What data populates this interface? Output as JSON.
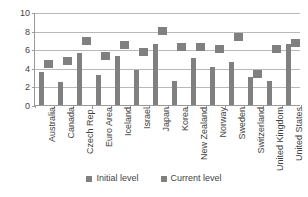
{
  "chart_data": {
    "type": "bar",
    "title": "",
    "subtitle": "",
    "xlabel": "",
    "ylabel": "",
    "ylim": [
      0,
      10
    ],
    "y_ticks": [
      0,
      2,
      4,
      6,
      8,
      10
    ],
    "grid": true,
    "legend_position": "bottom",
    "categories": [
      "Australia",
      "Canada",
      "Czech Rep.",
      "Euro Area",
      "Iceland",
      "Israel",
      "Japan",
      "Korea",
      "New Zealand",
      "Norway",
      "Sweden",
      "Switzerland",
      "United Kingdom",
      "United States"
    ],
    "series": [
      {
        "name": "Initial level",
        "mark": "bar",
        "color": "#808080",
        "values": [
          3.6,
          2.5,
          5.6,
          3.2,
          5.3,
          3.8,
          6.6,
          2.6,
          5.1,
          4.1,
          4.6,
          3.0,
          2.6,
          6.6
        ]
      },
      {
        "name": "Current level",
        "mark": "square-marker",
        "color": "#808080",
        "values": [
          4.5,
          4.8,
          7.0,
          5.4,
          6.6,
          5.8,
          8.1,
          6.3,
          6.3,
          6.1,
          7.4,
          3.4,
          6.1,
          6.8
        ]
      }
    ]
  },
  "legend": {
    "entries": [
      {
        "label": "Initial level"
      },
      {
        "label": "Current level"
      }
    ]
  },
  "colors": {
    "series": "#808080",
    "gridline": "#b9b9b9",
    "axis": "#9a9a9a",
    "text": "#3f3f3f",
    "background": "#ffffff"
  }
}
